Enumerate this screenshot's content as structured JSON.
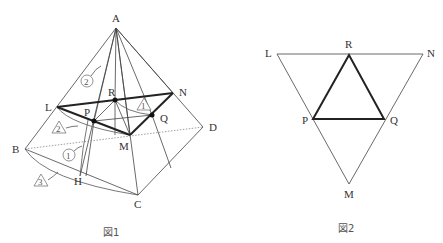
{
  "figure1": {
    "caption": "図1",
    "points": {
      "A": "A",
      "L": "L",
      "N": "N",
      "R": "R",
      "P": "P",
      "Q": "Q",
      "M": "M",
      "B": "B",
      "D": "D",
      "C": "C",
      "H": "H"
    },
    "annotations": {
      "circle1": "1",
      "circle2": "2",
      "tri1": "1",
      "tri2": "2",
      "tri3": "3"
    }
  },
  "figure2": {
    "caption": "図2",
    "points": {
      "L": "L",
      "R": "R",
      "N": "N",
      "P": "P",
      "Q": "Q",
      "M": "M"
    }
  }
}
